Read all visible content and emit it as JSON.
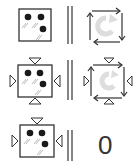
{
  "diagram": {
    "rows": [
      {
        "left": "dice-square",
        "relation": "parallel",
        "right": "rotation-cycle",
        "decorated": false
      },
      {
        "left": "dice-square-with-triangles",
        "relation": "parallel",
        "right": "rotation-cycle-with-triangles",
        "decorated": true
      },
      {
        "left": "dice-square-with-triangles",
        "relation": "parallel",
        "right_text": "0",
        "decorated": true
      }
    ],
    "colors": {
      "stroke": "#333333",
      "dot": "#1a1a1a",
      "arrow_fill": "#dddddd"
    }
  }
}
